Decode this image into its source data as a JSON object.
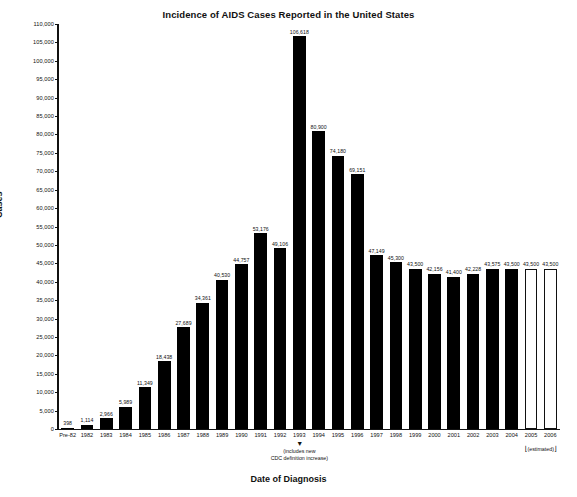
{
  "chart_data": {
    "type": "bar",
    "title": "Incidence of AIDS Cases Reported in the United States",
    "xlabel": "Date of Diagnosis",
    "ylabel": "Cases",
    "ylim": [
      0,
      110000
    ],
    "ytick_step": 5000,
    "grid": false,
    "legend": "none",
    "categories": [
      "Pre-82",
      "1982",
      "1983",
      "1984",
      "1985",
      "1986",
      "1987",
      "1988",
      "1989",
      "1990",
      "1991",
      "1992",
      "1993",
      "1994",
      "1995",
      "1996",
      "1997",
      "1998",
      "1999",
      "2000",
      "2001",
      "2002",
      "2003",
      "2004",
      "2005",
      "2006"
    ],
    "values": [
      398,
      1114,
      2966,
      5989,
      11349,
      18438,
      27689,
      34361,
      40530,
      44757,
      53176,
      49106,
      106618,
      80900,
      74180,
      69151,
      47149,
      45300,
      43500,
      42156,
      41400,
      42228,
      43575,
      43500,
      43500,
      43500
    ],
    "value_labels": [
      "398",
      "1,114",
      "2,966",
      "5,989",
      "11,349",
      "18,438",
      "27,689",
      "34,361",
      "40,530",
      "44,757",
      "53,176",
      "49,106",
      "106,618",
      "80,900",
      "74,180",
      "69,151",
      "47,149",
      "45,300",
      "43,500",
      "42,156",
      "41,400",
      "42,228",
      "43,575",
      "43,500",
      "43,500",
      "43,500"
    ],
    "estimated_categories": [
      "2005",
      "2006"
    ],
    "estimated_note": "(estimated)",
    "ytick_labels": [
      "0",
      "5,000",
      "10,000",
      "15,000",
      "20,000",
      "25,000",
      "30,000",
      "35,000",
      "40,000",
      "45,000",
      "50,000",
      "55,000",
      "60,000",
      "65,000",
      "70,000",
      "75,000",
      "80,000",
      "85,000",
      "90,000",
      "95,000",
      "100,000",
      "105,000",
      "110,000"
    ],
    "annotations": [
      {
        "target": "1993",
        "line1": "(includes new",
        "line2": "CDC definition increase)",
        "arrow": "▼"
      }
    ],
    "colors": {
      "bar": "#000000",
      "bar_estimated_fill": "#ffffff",
      "bar_estimated_stroke": "#111111",
      "axis": "#111111",
      "text": "#111111",
      "background": "#ffffff"
    }
  }
}
